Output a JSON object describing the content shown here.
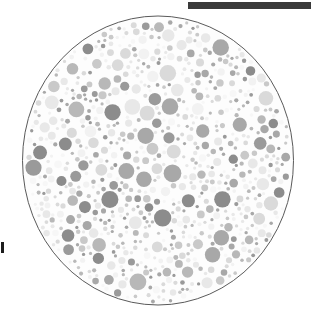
{
  "figure": {
    "kind": "pseudoisochromatic-test-plate",
    "background_color": "#ffffff"
  },
  "top_rule": {
    "name": "horizontal-rule",
    "color": "#3a3a3a",
    "x": 188,
    "y": 2,
    "width": 123,
    "height": 7
  },
  "margin_mark": {
    "name": "cropped-text-fragment",
    "color": "#1d1d1d",
    "x": 1,
    "y": 242
  },
  "plate": {
    "name": "ishihara-plate",
    "center_x": 157,
    "center_y": 160,
    "radius": 136,
    "outline_color": "#5a5a5a",
    "outline_width": 1,
    "fill_color": "#fdfdfd",
    "dot_count": 760,
    "dot_palette": [
      "#8c8c8c",
      "#9a9a9a",
      "#a8a8a8",
      "#b8b8b8",
      "#c9c9c9",
      "#dadada",
      "#e8e8e8",
      "#f2f2f2",
      "#f7f7f7"
    ],
    "dot_radius_min": 1.6,
    "dot_radius_max": 9.5
  }
}
